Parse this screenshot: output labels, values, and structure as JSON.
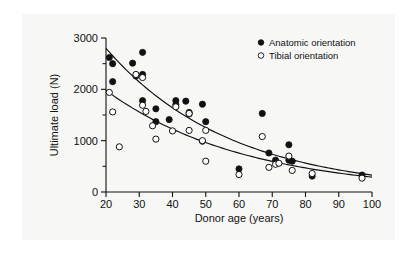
{
  "chart_data": {
    "type": "scatter",
    "title": "",
    "xlabel": "Donor age (years)",
    "ylabel": "Ultimate load (N)",
    "xlim": [
      20,
      100
    ],
    "ylim": [
      0,
      3000
    ],
    "xticks": [
      20,
      30,
      40,
      50,
      60,
      70,
      80,
      90,
      100
    ],
    "yticks": [
      0,
      1000,
      2000,
      3000
    ],
    "y_minor_ticks": [
      500,
      1500,
      2500
    ],
    "grid": false,
    "legend_position": "top-right",
    "series": [
      {
        "name": "Anatomic orientation",
        "marker": "filled-circle",
        "color": "#111111",
        "points": [
          [
            21,
            2620
          ],
          [
            22,
            2500
          ],
          [
            22,
            2150
          ],
          [
            28,
            2510
          ],
          [
            29,
            2260
          ],
          [
            31,
            2720
          ],
          [
            31,
            2290
          ],
          [
            31,
            1780
          ],
          [
            35,
            1620
          ],
          [
            35,
            1370
          ],
          [
            39,
            1410
          ],
          [
            41,
            1700
          ],
          [
            41,
            1780
          ],
          [
            44,
            1770
          ],
          [
            45,
            1520
          ],
          [
            45,
            1550
          ],
          [
            49,
            1710
          ],
          [
            50,
            1370
          ],
          [
            49,
            990
          ],
          [
            60,
            450
          ],
          [
            67,
            1530
          ],
          [
            69,
            760
          ],
          [
            71,
            620
          ],
          [
            75,
            920
          ],
          [
            75,
            620
          ],
          [
            76,
            600
          ],
          [
            82,
            310
          ],
          [
            97,
            330
          ]
        ]
      },
      {
        "name": "Tibial orientation",
        "marker": "open-circle",
        "color": "#111111",
        "points": [
          [
            21,
            1940
          ],
          [
            22,
            1560
          ],
          [
            24,
            880
          ],
          [
            29,
            2290
          ],
          [
            31,
            2230
          ],
          [
            31,
            1690
          ],
          [
            32,
            1570
          ],
          [
            34,
            1290
          ],
          [
            35,
            1030
          ],
          [
            40,
            1190
          ],
          [
            41,
            1660
          ],
          [
            45,
            1530
          ],
          [
            45,
            1200
          ],
          [
            49,
            1000
          ],
          [
            50,
            1200
          ],
          [
            50,
            600
          ],
          [
            60,
            340
          ],
          [
            67,
            1080
          ],
          [
            69,
            480
          ],
          [
            71,
            540
          ],
          [
            72,
            560
          ],
          [
            75,
            700
          ],
          [
            76,
            420
          ],
          [
            82,
            360
          ],
          [
            97,
            270
          ]
        ]
      }
    ],
    "fit_curves": [
      {
        "name": "Anatomic orientation fit",
        "series": "Anatomic orientation",
        "endpoints": [
          [
            20,
            2800
          ],
          [
            100,
            330
          ]
        ]
      },
      {
        "name": "Tibial orientation fit",
        "series": "Tibial orientation",
        "endpoints": [
          [
            20,
            1980
          ],
          [
            100,
            290
          ]
        ]
      }
    ]
  },
  "axes": {
    "x_title": "Donor age (years)",
    "y_title": "Ultimate load (N)",
    "x_tick_labels": [
      "20",
      "30",
      "40",
      "50",
      "60",
      "70",
      "80",
      "90",
      "100"
    ],
    "y_tick_labels": [
      "0",
      "1000",
      "2000",
      "3000"
    ]
  },
  "legend": {
    "items": [
      {
        "label": "Anatomic orientation",
        "marker": "filled-circle"
      },
      {
        "label": "Tibial orientation",
        "marker": "open-circle"
      }
    ]
  },
  "colors": {
    "ink": "#111111",
    "panel_background": "#f7f7f6",
    "page_background": "#ffffff"
  }
}
